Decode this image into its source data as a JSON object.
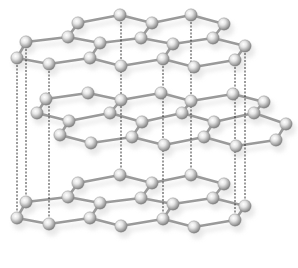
{
  "diagram": {
    "colors": {
      "background": "#ffffff",
      "bond": "#9a9a9a",
      "atom_light": "#f2f2f2",
      "atom_dark": "#7a7a7a",
      "dashed_line": "#222222",
      "shadow": "#d8d8d8"
    },
    "layers": [
      {
        "name": "top-layer",
        "atoms": [
          [
            78,
            23
          ],
          [
            120,
            15
          ],
          [
            152,
            23
          ],
          [
            191,
            15
          ],
          [
            224,
            24
          ],
          [
            26,
            42
          ],
          [
            68,
            37
          ],
          [
            100,
            43
          ],
          [
            141,
            38
          ],
          [
            173,
            44
          ],
          [
            213,
            38
          ],
          [
            245,
            46
          ],
          [
            17,
            58
          ],
          [
            49,
            64
          ],
          [
            90,
            58
          ],
          [
            121,
            66
          ],
          [
            163,
            59
          ],
          [
            194,
            67
          ],
          [
            235,
            60
          ]
        ],
        "bonds": [
          [
            0,
            1
          ],
          [
            1,
            2
          ],
          [
            2,
            3
          ],
          [
            3,
            4
          ],
          [
            0,
            6
          ],
          [
            2,
            8
          ],
          [
            4,
            10
          ],
          [
            5,
            6
          ],
          [
            6,
            7
          ],
          [
            7,
            8
          ],
          [
            8,
            9
          ],
          [
            9,
            10
          ],
          [
            10,
            11
          ],
          [
            5,
            12
          ],
          [
            7,
            14
          ],
          [
            9,
            16
          ],
          [
            11,
            18
          ],
          [
            12,
            13
          ],
          [
            13,
            14
          ],
          [
            14,
            15
          ],
          [
            15,
            16
          ],
          [
            16,
            17
          ],
          [
            17,
            18
          ]
        ]
      },
      {
        "name": "middle-layer",
        "atoms": [
          [
            46,
            99
          ],
          [
            88,
            93
          ],
          [
            121,
            100
          ],
          [
            161,
            93
          ],
          [
            191,
            101
          ],
          [
            233,
            94
          ],
          [
            264,
            102
          ],
          [
            37,
            113
          ],
          [
            69,
            121
          ],
          [
            110,
            113
          ],
          [
            142,
            122
          ],
          [
            182,
            113
          ],
          [
            214,
            122
          ],
          [
            254,
            113
          ],
          [
            286,
            124
          ],
          [
            60,
            135
          ],
          [
            91,
            143
          ],
          [
            132,
            137
          ],
          [
            164,
            145
          ],
          [
            204,
            137
          ],
          [
            236,
            146
          ],
          [
            276,
            140
          ]
        ],
        "bonds": [
          [
            0,
            1
          ],
          [
            1,
            2
          ],
          [
            2,
            3
          ],
          [
            3,
            4
          ],
          [
            4,
            5
          ],
          [
            5,
            6
          ],
          [
            0,
            7
          ],
          [
            2,
            9
          ],
          [
            4,
            11
          ],
          [
            6,
            13
          ],
          [
            7,
            8
          ],
          [
            8,
            9
          ],
          [
            9,
            10
          ],
          [
            10,
            11
          ],
          [
            11,
            12
          ],
          [
            12,
            13
          ],
          [
            13,
            14
          ],
          [
            8,
            15
          ],
          [
            10,
            17
          ],
          [
            12,
            19
          ],
          [
            14,
            21
          ],
          [
            15,
            16
          ],
          [
            16,
            17
          ],
          [
            17,
            18
          ],
          [
            18,
            19
          ],
          [
            19,
            20
          ],
          [
            20,
            21
          ]
        ]
      },
      {
        "name": "bottom-layer",
        "atoms": [
          [
            78,
            183
          ],
          [
            120,
            175
          ],
          [
            152,
            183
          ],
          [
            191,
            175
          ],
          [
            224,
            184
          ],
          [
            26,
            202
          ],
          [
            68,
            197
          ],
          [
            100,
            203
          ],
          [
            141,
            198
          ],
          [
            173,
            204
          ],
          [
            213,
            198
          ],
          [
            245,
            206
          ],
          [
            17,
            218
          ],
          [
            49,
            224
          ],
          [
            90,
            218
          ],
          [
            121,
            226
          ],
          [
            163,
            219
          ],
          [
            194,
            227
          ],
          [
            235,
            220
          ]
        ],
        "bonds": [
          [
            0,
            1
          ],
          [
            1,
            2
          ],
          [
            2,
            3
          ],
          [
            3,
            4
          ],
          [
            0,
            6
          ],
          [
            2,
            8
          ],
          [
            4,
            10
          ],
          [
            5,
            6
          ],
          [
            6,
            7
          ],
          [
            7,
            8
          ],
          [
            8,
            9
          ],
          [
            9,
            10
          ],
          [
            10,
            11
          ],
          [
            5,
            12
          ],
          [
            7,
            14
          ],
          [
            9,
            16
          ],
          [
            11,
            18
          ],
          [
            12,
            13
          ],
          [
            13,
            14
          ],
          [
            14,
            15
          ],
          [
            15,
            16
          ],
          [
            16,
            17
          ],
          [
            17,
            18
          ]
        ]
      }
    ],
    "dashed_lines": [
      {
        "x": 17,
        "y1": 58,
        "y2": 218
      },
      {
        "x": 26,
        "y1": 42,
        "y2": 202
      },
      {
        "x": 49,
        "y1": 64,
        "y2": 224
      },
      {
        "x": 121,
        "y1": 15,
        "y2": 175
      },
      {
        "x": 163,
        "y1": 59,
        "y2": 219
      },
      {
        "x": 191,
        "y1": 15,
        "y2": 175
      },
      {
        "x": 235,
        "y1": 60,
        "y2": 220
      },
      {
        "x": 245,
        "y1": 46,
        "y2": 206
      }
    ],
    "atom_radius": 6.2
  }
}
